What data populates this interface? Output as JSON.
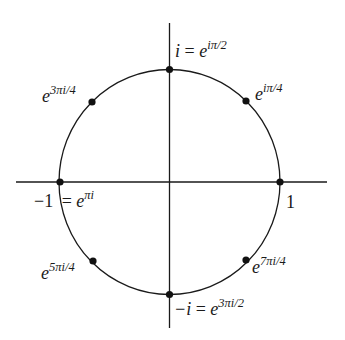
{
  "figure": {
    "center": {
      "x": 169.5,
      "y": 182
    },
    "radius": 111,
    "axis_color": "#1a1a1a",
    "curve_color": "#1a1a1a",
    "dot_color": "#111111"
  },
  "axes": {
    "horizontal": {
      "x1": 16,
      "x2": 327,
      "y": 182
    },
    "vertical": {
      "x": 169.5,
      "y1": 23,
      "y2": 328
    }
  },
  "points": [
    {
      "id": "e0",
      "angle": "0",
      "x": 280,
      "y": 182
    },
    {
      "id": "e1",
      "angle": "π/4",
      "x": 246,
      "y": 101
    },
    {
      "id": "e2",
      "angle": "π/2",
      "x": 169.5,
      "y": 69
    },
    {
      "id": "e3",
      "angle": "3π/4",
      "x": 92,
      "y": 102
    },
    {
      "id": "e4",
      "angle": "π",
      "x": 60,
      "y": 182
    },
    {
      "id": "e5",
      "angle": "5π/4",
      "x": 93,
      "y": 261
    },
    {
      "id": "e6",
      "angle": "3π/2",
      "x": 169.5,
      "y": 294
    },
    {
      "id": "e7",
      "angle": "7π/4",
      "x": 246,
      "y": 260
    }
  ],
  "labels": {
    "one": {
      "base": "1"
    },
    "i_top": {
      "lhs": "i",
      "eq": " = ",
      "base": "e",
      "exp": "iπ/2"
    },
    "pi4": {
      "base": "e",
      "exp": "iπ/4"
    },
    "three_pi4": {
      "base": "e",
      "exp": "3πi/4"
    },
    "minus_one": {
      "lhs": "−1",
      "eq": " = ",
      "base": "e",
      "exp": "πi"
    },
    "five_pi4": {
      "base": "e",
      "exp": "5πi/4"
    },
    "minus_i": {
      "lhs": "−i",
      "eq": " = ",
      "base": "e",
      "exp": "3πi/2"
    },
    "seven_pi4": {
      "base": "e",
      "exp": "7πi/4"
    }
  }
}
